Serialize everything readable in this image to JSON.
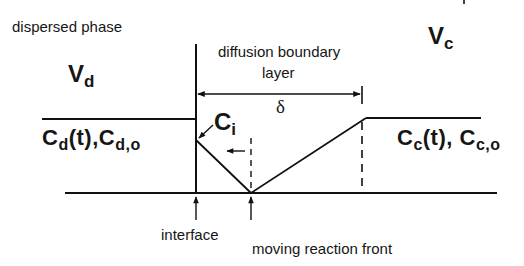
{
  "diagram": {
    "labels": {
      "dispersed_phase": "dispersed phase",
      "vd_main": "V",
      "vd_sub": "d",
      "vc_main": "V",
      "vc_sub": "c",
      "boundary_line1": "diffusion boundary",
      "boundary_line2": "layer",
      "delta": "δ",
      "ci_main": "C",
      "ci_sub": "i",
      "cd_c1": "C",
      "cd_s1": "d",
      "cd_mid": "(t),",
      "cd_c2": "C",
      "cd_s2": "d,o",
      "cc_c1": "C",
      "cc_s1": "c",
      "cc_mid": "(t),",
      "cc_c2": "C",
      "cc_s2": "c,o",
      "interface": "interface",
      "reaction_front": "moving reaction front"
    },
    "geometry": {
      "interface_x": 196,
      "reaction_front_x": 251,
      "boundary_edge_x": 362,
      "baseline_y": 193,
      "level_y": 119,
      "ci_y": 140,
      "delta_arrow_y": 94
    },
    "colors": {
      "line": "#111111",
      "background": "#ffffff"
    }
  }
}
